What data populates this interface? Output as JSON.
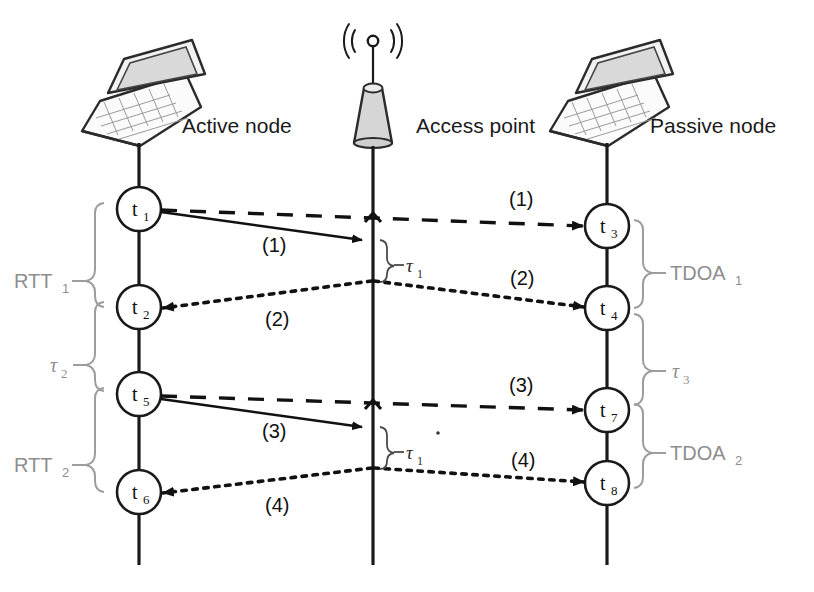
{
  "diagram": {
    "colors": {
      "ink": "#111111",
      "bracket_gray": "#9d9d9d",
      "label_gray": "#8e8e8e",
      "laptop_screen": "#d9d9d9",
      "access_point_fill": "#d6d6d6",
      "background": "#ffffff"
    },
    "lanes": [
      {
        "id": "active",
        "role_label": "Active node",
        "icon": "laptop-icon",
        "x": 139
      },
      {
        "id": "ap",
        "role_label": "Access point",
        "icon": "access-point-antenna-icon",
        "x": 373
      },
      {
        "id": "passive",
        "role_label": "Passive node",
        "icon": "laptop-icon",
        "x": 607
      }
    ],
    "nodes": [
      {
        "id": "t1",
        "base": "t",
        "sub": "1",
        "lane": "active",
        "x": 139,
        "y": 209
      },
      {
        "id": "t2",
        "base": "t",
        "sub": "2",
        "lane": "active",
        "x": 139,
        "y": 307
      },
      {
        "id": "t5",
        "base": "t",
        "sub": "5",
        "lane": "active",
        "x": 139,
        "y": 394
      },
      {
        "id": "t6",
        "base": "t",
        "sub": "6",
        "lane": "active",
        "x": 139,
        "y": 492
      },
      {
        "id": "t3",
        "base": "t",
        "sub": "3",
        "lane": "passive",
        "x": 607,
        "y": 226
      },
      {
        "id": "t4",
        "base": "t",
        "sub": "4",
        "lane": "passive",
        "x": 607,
        "y": 308
      },
      {
        "id": "t7",
        "base": "t",
        "sub": "7",
        "lane": "passive",
        "x": 607,
        "y": 410
      },
      {
        "id": "t8",
        "base": "t",
        "sub": "8",
        "lane": "passive",
        "x": 607,
        "y": 483
      }
    ],
    "messages": [
      {
        "id": "m1-solid",
        "label": "(1)",
        "style": "solid",
        "from": "t1",
        "to": "ap",
        "label_x": 262,
        "label_y": 252
      },
      {
        "id": "m1-dashed",
        "label": "(1)",
        "style": "dashed",
        "from": "t1",
        "to": "t3",
        "label_x": 509,
        "label_y": 206
      },
      {
        "id": "m2-dotted-right",
        "label": "(2)",
        "style": "dotted",
        "from": "ap",
        "to": "t4",
        "label_x": 510,
        "label_y": 285
      },
      {
        "id": "m2-dotted-left",
        "label": "(2)",
        "style": "dotted",
        "from": "ap",
        "to": "t2",
        "label_x": 265,
        "label_y": 326
      },
      {
        "id": "m3-solid",
        "label": "(3)",
        "style": "solid",
        "from": "t5",
        "to": "ap",
        "label_x": 262,
        "label_y": 438
      },
      {
        "id": "m3-dashed",
        "label": "(3)",
        "style": "dashed",
        "from": "t5",
        "to": "t7",
        "label_x": 509,
        "label_y": 392
      },
      {
        "id": "m4-dotted-right",
        "label": "(4)",
        "style": "dotted",
        "from": "ap",
        "to": "t8",
        "label_x": 511,
        "label_y": 467
      },
      {
        "id": "m4-dotted-left",
        "label": "(4)",
        "style": "dotted",
        "from": "ap",
        "to": "t6",
        "label_x": 265,
        "label_y": 512
      }
    ],
    "brackets": [
      {
        "id": "rtt1",
        "label": "RTT",
        "sub": "1",
        "side": "left",
        "from_node": "t1",
        "to_node": "t2",
        "label_x": 18,
        "label_y": 281
      },
      {
        "id": "tau2",
        "label": "τ",
        "sub": "2",
        "side": "left",
        "from_node": "t2",
        "to_node": "t5",
        "label_x": 52,
        "label_y": 365
      },
      {
        "id": "rtt2",
        "label": "RTT",
        "sub": "2",
        "side": "left",
        "from_node": "t5",
        "to_node": "t6",
        "label_x": 18,
        "label_y": 465
      },
      {
        "id": "tdoa1",
        "label": "TDOA",
        "sub": "1",
        "side": "right",
        "from_node": "t3",
        "to_node": "t4",
        "label_x": 672,
        "label_y": 273
      },
      {
        "id": "tau3",
        "label": "τ",
        "sub": "3",
        "side": "right",
        "from_node": "t4",
        "to_node": "t7",
        "label_x": 682,
        "label_y": 371
      },
      {
        "id": "tdoa2",
        "label": "TDOA",
        "sub": "2",
        "side": "right",
        "from_node": "t7",
        "to_node": "t8",
        "label_x": 672,
        "label_y": 453
      },
      {
        "id": "tau1a",
        "label": "τ",
        "sub": "1",
        "side": "ap",
        "from_y": 240,
        "to_y": 281,
        "label_x": 403,
        "label_y": 264
      },
      {
        "id": "tau1b",
        "label": "τ",
        "sub": "1",
        "side": "ap",
        "from_y": 427,
        "to_y": 468,
        "label_x": 403,
        "label_y": 451
      }
    ]
  }
}
